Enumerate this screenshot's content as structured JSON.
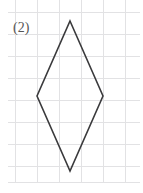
{
  "figure": {
    "label": "(2)",
    "width": 143,
    "height": 193,
    "background_color": "#ffffff"
  },
  "grid": {
    "cell_size": 22,
    "line_color": "#e2e2e4",
    "line_width": 1,
    "x_origin": 15,
    "y_origin": 12,
    "vertical_lines": [
      15,
      37,
      59,
      81,
      103,
      125
    ],
    "horizontal_lines": [
      12,
      34,
      56,
      78,
      100,
      122,
      144,
      166,
      182
    ],
    "x_extent": [
      8,
      140
    ],
    "y_extent": [
      0,
      183
    ]
  },
  "shape": {
    "name": "rhombus",
    "stroke_color": "#3a3a3c",
    "stroke_width": 1.6,
    "fill": "none",
    "vertices": [
      {
        "name": "top",
        "x": 70,
        "y": 21
      },
      {
        "name": "right",
        "x": 103,
        "y": 96
      },
      {
        "name": "bottom",
        "x": 70,
        "y": 171
      },
      {
        "name": "left",
        "x": 37,
        "y": 96
      }
    ],
    "points_attr": "70,21 103,96 70,171 37,96",
    "diagonal_horizontal_cells": 3,
    "diagonal_vertical_cells": 6.8
  }
}
